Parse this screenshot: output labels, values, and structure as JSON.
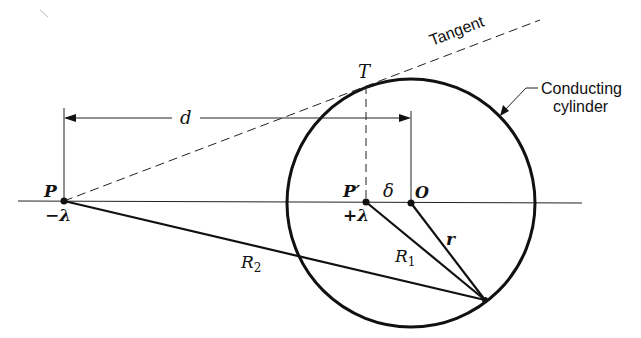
{
  "diagram": {
    "labels": {
      "tangent": "Tangent",
      "conducting_cylinder_line1": "Conducting",
      "conducting_cylinder_line2": "cylinder",
      "T": "T",
      "d": "d",
      "P": "P",
      "P_prime": "P′",
      "minus_lambda": "−λ",
      "plus_lambda": "+λ",
      "delta": "δ",
      "O": "O",
      "r": "r",
      "R1": "R",
      "R1_sub": "1",
      "R2": "R",
      "R2_sub": "2"
    },
    "points": {
      "P": {
        "x": 64,
        "y": 201
      },
      "P_prime": {
        "x": 366,
        "y": 202
      },
      "O": {
        "x": 411,
        "y": 203
      },
      "T": {
        "x": 366,
        "y": 86
      },
      "Q": {
        "x": 485,
        "y": 300
      }
    },
    "circle": {
      "cx": 411,
      "cy": 203,
      "r": 124
    },
    "colors": {
      "ink": "#111111",
      "background": "#ffffff"
    }
  }
}
